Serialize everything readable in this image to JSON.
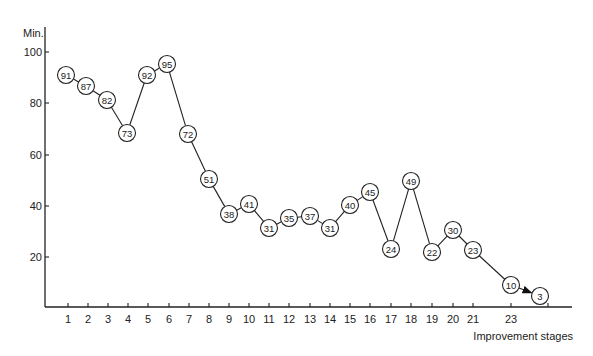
{
  "chart_data": {
    "type": "line",
    "title": "",
    "xlabel": "Improvement stages",
    "ylabel": "Min.",
    "ylim": [
      0,
      105
    ],
    "grid": false,
    "legend": null,
    "y_ticks": [
      20,
      40,
      60,
      80,
      100
    ],
    "x_ticks": [
      {
        "pos": 1,
        "label": "1"
      },
      {
        "pos": 2,
        "label": "2"
      },
      {
        "pos": 3,
        "label": "3"
      },
      {
        "pos": 4,
        "label": "4"
      },
      {
        "pos": 5,
        "label": "5"
      },
      {
        "pos": 6,
        "label": "6"
      },
      {
        "pos": 7,
        "label": "7"
      },
      {
        "pos": 8,
        "label": "8"
      },
      {
        "pos": 9,
        "label": "9"
      },
      {
        "pos": 10,
        "label": "10"
      },
      {
        "pos": 11,
        "label": "11"
      },
      {
        "pos": 12,
        "label": "12"
      },
      {
        "pos": 13,
        "label": "13"
      },
      {
        "pos": 14,
        "label": "14"
      },
      {
        "pos": 15,
        "label": "15"
      },
      {
        "pos": 16,
        "label": "16"
      },
      {
        "pos": 17,
        "label": "17"
      },
      {
        "pos": 18,
        "label": "18"
      },
      {
        "pos": 19,
        "label": "19"
      },
      {
        "pos": 20,
        "label": "20"
      },
      {
        "pos": 21,
        "label": "21"
      },
      {
        "pos": 22.85,
        "label": "23"
      },
      {
        "pos": 24.7,
        "label": ""
      }
    ],
    "series": [
      {
        "name": "Minutes",
        "x": [
          1,
          2,
          3,
          4,
          5,
          6,
          7,
          8,
          9,
          10,
          11,
          12,
          13,
          14,
          15,
          16,
          17,
          18,
          19,
          20,
          21,
          23,
          24
        ],
        "values": [
          91,
          87,
          82,
          73,
          92,
          95,
          72,
          51,
          38,
          41,
          31,
          35,
          37,
          31,
          40,
          45,
          24,
          49,
          22,
          30,
          23,
          10,
          3
        ],
        "markers": "circled-value",
        "annotation": "arrow from 10 to 3"
      }
    ],
    "points_px": [
      [
        66,
        75
      ],
      [
        86,
        86
      ],
      [
        107,
        100
      ],
      [
        127,
        133
      ],
      [
        147,
        75
      ],
      [
        167,
        64
      ],
      [
        188,
        134
      ],
      [
        209,
        179
      ],
      [
        229,
        214
      ],
      [
        249,
        204
      ],
      [
        269,
        228
      ],
      [
        289,
        218
      ],
      [
        310,
        216
      ],
      [
        330,
        228
      ],
      [
        350,
        205
      ],
      [
        370,
        192
      ],
      [
        391,
        249
      ],
      [
        411,
        181
      ],
      [
        432,
        252
      ],
      [
        453,
        230
      ],
      [
        473,
        250
      ],
      [
        511,
        285
      ],
      [
        540,
        296
      ]
    ],
    "axes_px": {
      "origin_x": 45,
      "origin_y": 307,
      "top_y": 27,
      "right_x": 572,
      "y_tick_px": [
        257,
        206,
        155,
        103,
        52
      ],
      "x_tick_px": [
        68,
        88,
        108,
        128,
        148,
        169,
        189,
        209,
        229,
        249,
        269,
        289,
        310,
        330,
        350,
        370,
        391,
        411,
        432,
        453,
        473,
        511,
        548
      ]
    }
  }
}
